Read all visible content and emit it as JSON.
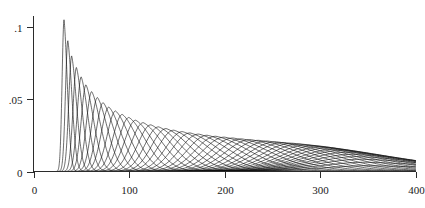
{
  "chart_data": {
    "type": "line",
    "title": "",
    "subtitle": "",
    "xlabel": "",
    "ylabel": "",
    "xlim": [
      0,
      400
    ],
    "ylim": [
      0,
      0.105
    ],
    "grid": false,
    "legend": false,
    "legend_position": "none",
    "background_color": "#ffffff",
    "line_color": "#111111",
    "axis_color": "#2b2b2b",
    "x_ticks": [
      0,
      100,
      200,
      300,
      400
    ],
    "x_tick_labels": [
      "0",
      "100",
      "200",
      "300",
      "400"
    ],
    "y_ticks": [
      0,
      0.05,
      0.1
    ],
    "y_tick_labels": [
      "0",
      ".05",
      ".1"
    ],
    "n_series": 46,
    "series_modes": [
      32,
      36,
      40,
      45,
      50,
      55,
      61,
      67,
      73,
      79,
      86,
      93,
      100,
      107,
      115,
      123,
      131,
      139,
      147,
      156,
      164,
      173,
      182,
      191,
      200,
      209,
      218,
      227,
      236,
      245,
      254,
      262,
      271,
      279,
      287,
      295,
      302,
      309,
      316,
      322,
      328,
      334,
      339,
      344,
      348,
      352
    ],
    "series_peaks": [
      0.105,
      0.0905,
      0.08,
      0.072,
      0.0655,
      0.06,
      0.0553,
      0.0512,
      0.0477,
      0.0446,
      0.0419,
      0.0395,
      0.0374,
      0.0355,
      0.0338,
      0.0323,
      0.0309,
      0.0297,
      0.0286,
      0.0276,
      0.0267,
      0.0259,
      0.0251,
      0.0244,
      0.0238,
      0.0232,
      0.0226,
      0.0221,
      0.0216,
      0.0211,
      0.0206,
      0.0201,
      0.0196,
      0.0191,
      0.0185,
      0.0179,
      0.0172,
      0.0164,
      0.0155,
      0.0145,
      0.0133,
      0.0119,
      0.0103,
      0.0085,
      0.0064,
      0.004
    ],
    "series_widths": [
      2.6,
      3.2,
      3.9,
      4.6,
      5.4,
      6.2,
      7.1,
      8.0,
      9.0,
      10.0,
      11.0,
      12.1,
      13.2,
      14.3,
      15.5,
      16.7,
      17.9,
      19.1,
      20.4,
      21.7,
      23.0,
      24.3,
      25.7,
      27.1,
      28.5,
      29.9,
      31.3,
      32.8,
      34.3,
      35.8,
      37.3,
      38.9,
      40.5,
      42.1,
      43.7,
      45.4,
      47.1,
      48.8,
      50.5,
      52.3,
      54.1,
      55.9,
      57.7,
      59.6,
      61.5,
      63.4
    ]
  },
  "axes": {
    "x_axis_name": "x-axis",
    "y_axis_name": "y-axis"
  }
}
